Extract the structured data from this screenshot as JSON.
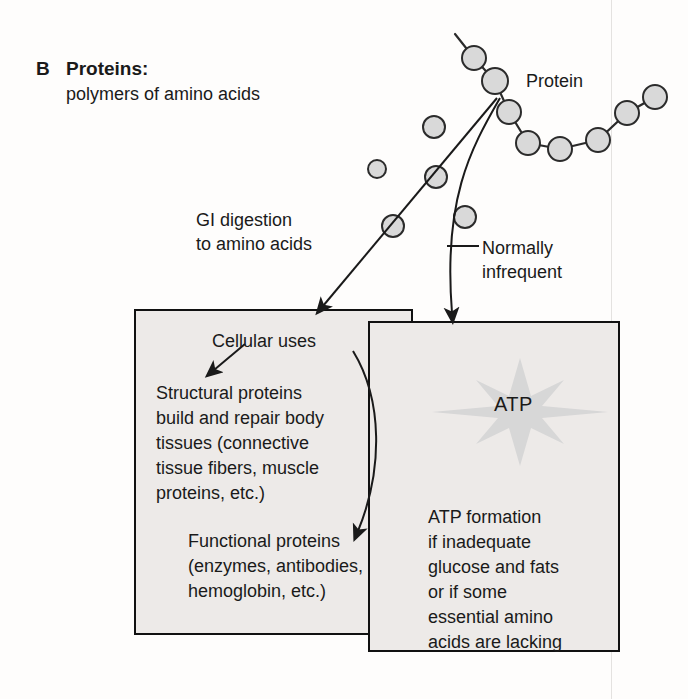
{
  "panel": {
    "letter": "B",
    "title": "Proteins:",
    "subtitle": "polymers of amino acids"
  },
  "labels": {
    "protein": "Protein",
    "gi_digestion": "GI digestion\nto amino acids",
    "normally_infrequent": "Normally\ninfrequent",
    "cellular_uses": "Cellular uses",
    "atp": "ATP"
  },
  "boxes": {
    "left": {
      "structural": "Structural proteins\nbuild and repair body\ntissues (connective\ntissue fibers, muscle\nproteins, etc.)",
      "functional": "Functional proteins\n(enzymes, antibodies,\nhemoglobin, etc.)"
    },
    "right": {
      "atp_formation": "ATP formation\nif inadequate\nglucose and fats\nor if some\nessential amino\nacids are lacking"
    }
  },
  "colors": {
    "molecule_fill": "#d9d9d9",
    "molecule_stroke": "#2b2b2b",
    "box_fill": "#edeae8",
    "box_stroke": "#111111",
    "burst_fill": "#d7d7d7",
    "text": "#1a1a1a",
    "scanline": "#e4e2e0"
  },
  "diagram": {
    "type": "flow-diagram",
    "protein_chain_nodes": [
      {
        "cx": 474,
        "cy": 58,
        "r": 12
      },
      {
        "cx": 495,
        "cy": 81,
        "r": 13
      },
      {
        "cx": 509,
        "cy": 112,
        "r": 12
      },
      {
        "cx": 528,
        "cy": 143,
        "r": 12
      },
      {
        "cx": 560,
        "cy": 149,
        "r": 12
      },
      {
        "cx": 598,
        "cy": 140,
        "r": 12
      },
      {
        "cx": 627,
        "cy": 113,
        "r": 12
      },
      {
        "cx": 655,
        "cy": 97,
        "r": 12
      }
    ],
    "free_amino_acids": [
      {
        "cx": 434,
        "cy": 127,
        "r": 11
      },
      {
        "cx": 377,
        "cy": 169,
        "r": 9
      },
      {
        "cx": 436,
        "cy": 177,
        "r": 11
      },
      {
        "cx": 393,
        "cy": 226,
        "r": 11
      },
      {
        "cx": 465,
        "cy": 217,
        "r": 11
      }
    ],
    "arrows": [
      {
        "name": "gi-digestion-arrow",
        "from": [
          497,
          98
        ],
        "to": [
          320,
          311
        ]
      },
      {
        "name": "normally-infrequent-arrow",
        "from": [
          500,
          98
        ],
        "to": [
          458,
          322
        ]
      },
      {
        "name": "cellular-uses-arrow",
        "from": [
          243,
          343
        ],
        "to": [
          216,
          372
        ]
      },
      {
        "name": "structural-to-functional-arrow",
        "from": [
          355,
          352
        ],
        "to": [
          355,
          538
        ]
      }
    ]
  }
}
